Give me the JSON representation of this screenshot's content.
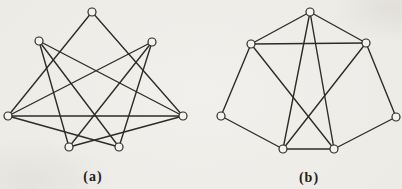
{
  "figure": {
    "paper_color": "#edebe6",
    "ink_color": "#2e2c27",
    "node_fill_color": "#f4f2ee",
    "node_radius": 4,
    "edge_width": 1.4,
    "graphs": [
      {
        "id": "a",
        "label": "(a)",
        "label_pos": {
          "x": 93,
          "y": 177
        },
        "nodes": {
          "top": [
            92,
            12
          ],
          "upper-left": [
            39,
            41
          ],
          "upper-right": [
            152,
            42
          ],
          "left": [
            8,
            116
          ],
          "right": [
            183,
            116
          ],
          "bottom-left": [
            69,
            147
          ],
          "bottom-right": [
            119,
            147
          ]
        },
        "edges": [
          [
            "top",
            "left"
          ],
          [
            "top",
            "right"
          ],
          [
            "left",
            "right"
          ],
          [
            "left",
            "upper-right"
          ],
          [
            "left",
            "bottom-right"
          ],
          [
            "right",
            "upper-left"
          ],
          [
            "right",
            "bottom-left"
          ],
          [
            "upper-left",
            "bottom-left"
          ],
          [
            "upper-left",
            "bottom-right"
          ],
          [
            "upper-right",
            "bottom-left"
          ],
          [
            "upper-right",
            "bottom-right"
          ]
        ]
      },
      {
        "id": "b",
        "label": "(b)",
        "label_pos": {
          "x": 309,
          "y": 178
        },
        "nodes": {
          "top": [
            310,
            12
          ],
          "upper-left": [
            251,
            44
          ],
          "upper-right": [
            366,
            43
          ],
          "left": [
            221,
            116
          ],
          "right": [
            396,
            117
          ],
          "bottom-left": [
            283,
            149
          ],
          "bottom-right": [
            334,
            149
          ]
        },
        "edges": [
          [
            "top",
            "upper-left"
          ],
          [
            "top",
            "upper-right"
          ],
          [
            "top",
            "bottom-left"
          ],
          [
            "top",
            "bottom-right"
          ],
          [
            "upper-left",
            "upper-right"
          ],
          [
            "upper-left",
            "left"
          ],
          [
            "upper-left",
            "bottom-right"
          ],
          [
            "upper-right",
            "right"
          ],
          [
            "upper-right",
            "bottom-left"
          ],
          [
            "left",
            "bottom-left"
          ],
          [
            "bottom-left",
            "bottom-right"
          ],
          [
            "bottom-right",
            "right"
          ]
        ]
      }
    ]
  }
}
